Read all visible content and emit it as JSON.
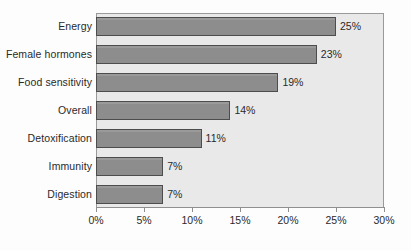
{
  "chart_data": {
    "type": "bar",
    "orientation": "horizontal",
    "title": "",
    "xlabel": "",
    "ylabel": "",
    "xlim": [
      0,
      30
    ],
    "grid": false,
    "legend": null,
    "categories": [
      "Energy",
      "Female hormones",
      "Food sensitivity",
      "Overall",
      "Detoxification",
      "Immunity",
      "Digestion"
    ],
    "values": [
      25,
      23,
      19,
      14,
      11,
      7,
      7
    ],
    "data_labels": [
      "25%",
      "23%",
      "19%",
      "14%",
      "11%",
      "7%",
      "7%"
    ],
    "xticks": [
      0,
      5,
      10,
      15,
      20,
      25,
      30
    ],
    "xtick_labels": [
      "0%",
      "5%",
      "10%",
      "15%",
      "20%",
      "25%",
      "30%"
    ],
    "colors": {
      "bar_fill": "#8d8d8d",
      "bar_border": "#4d4d4d",
      "plot_background": "#e9e9e9",
      "plot_border": "#9a9a9a",
      "axis": "#8f8f8f",
      "text": "#2a2a2a",
      "canvas": "#fdfdfd"
    }
  }
}
